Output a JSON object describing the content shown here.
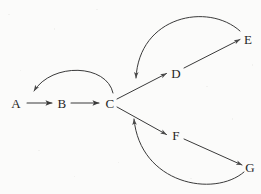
{
  "figure": {
    "kind": "directed-graph",
    "width": 261,
    "height": 194,
    "background_color": "#fbfbfa",
    "stroke_color": "#3a3a3a",
    "label_color": "#262626"
  },
  "nodes": [
    {
      "id": "A",
      "label": "A",
      "x": 16,
      "y": 103
    },
    {
      "id": "B",
      "label": "B",
      "x": 62,
      "y": 103
    },
    {
      "id": "C",
      "label": "C",
      "x": 110,
      "y": 103
    },
    {
      "id": "D",
      "label": "D",
      "x": 176,
      "y": 73
    },
    {
      "id": "E",
      "label": "E",
      "x": 248,
      "y": 39
    },
    {
      "id": "F",
      "label": "F",
      "x": 176,
      "y": 135
    },
    {
      "id": "G",
      "label": "G",
      "x": 250,
      "y": 167
    }
  ],
  "edges": [
    {
      "id": "a-to-b",
      "from": "A",
      "to": "B",
      "style": "straight",
      "arrow": "end"
    },
    {
      "id": "b-to-c",
      "from": "B",
      "to": "C",
      "style": "straight",
      "arrow": "end"
    },
    {
      "id": "c-to-d",
      "from": "C",
      "to": "D",
      "style": "straight",
      "arrow": "end"
    },
    {
      "id": "d-to-e",
      "from": "D",
      "to": "E",
      "style": "straight",
      "arrow": "end"
    },
    {
      "id": "c-to-f",
      "from": "C",
      "to": "F",
      "style": "straight",
      "arrow": "end"
    },
    {
      "id": "f-to-g",
      "from": "F",
      "to": "G",
      "style": "straight",
      "arrow": "end"
    },
    {
      "id": "c-to-a-arc",
      "from": "C",
      "to": "A",
      "style": "curved-above",
      "arrow": "end"
    },
    {
      "id": "e-to-cd-arc",
      "from": "E",
      "to": "c-d edge",
      "style": "curved-left-down",
      "arrow": "end"
    },
    {
      "id": "g-to-cf-arc",
      "from": "G",
      "to": "c-f edge",
      "style": "curved-left-up",
      "arrow": "end"
    }
  ],
  "geometry": {
    "a_to_b": {
      "x1": 27,
      "y1": 103,
      "x2": 53,
      "y2": 103
    },
    "b_to_c": {
      "x1": 71,
      "y1": 103,
      "x2": 100,
      "y2": 103
    },
    "c_to_e": {
      "x1": 117,
      "y1": 99,
      "x2": 241,
      "y2": 36
    },
    "c_to_g": {
      "x1": 117,
      "y1": 107,
      "x2": 243,
      "y2": 165
    },
    "d_arrow_tip": {
      "x": 167,
      "y": 73
    },
    "f_arrow_tip": {
      "x": 167,
      "y": 135
    },
    "arc_c_to_a": {
      "start_x": 113,
      "start_y": 94,
      "c1x": 104,
      "c1y": 66,
      "c2x": 50,
      "c2y": 66,
      "end_x": 33,
      "end_y": 92
    },
    "arc_e_to_cd": {
      "start_x": 240,
      "start_y": 31,
      "c1x": 210,
      "c1y": 4,
      "c2x": 140,
      "c2y": 22,
      "end_x": 136,
      "end_y": 79
    },
    "arc_g_to_cf": {
      "start_x": 244,
      "start_y": 172,
      "c1x": 215,
      "c1y": 196,
      "c2x": 142,
      "c2y": 180,
      "end_x": 134,
      "end_y": 118
    }
  }
}
